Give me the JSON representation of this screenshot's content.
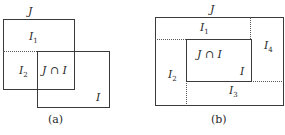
{
  "panel_a": {
    "caption": "(a)",
    "labels": {
      "J": "J",
      "I1_main": "I",
      "I1_sub": "1",
      "I2_main": "I",
      "I2_sub": "2",
      "intersection": "J ∩ I",
      "I": "I"
    }
  },
  "panel_b": {
    "caption": "(b)",
    "labels": {
      "J": "J",
      "I1_main": "I",
      "I1_sub": "1",
      "I2_main": "I",
      "I2_sub": "2",
      "I3_main": "I",
      "I3_sub": "3",
      "I4_main": "I",
      "I4_sub": "4",
      "intersection": "J ∩ I",
      "I": "I"
    }
  }
}
